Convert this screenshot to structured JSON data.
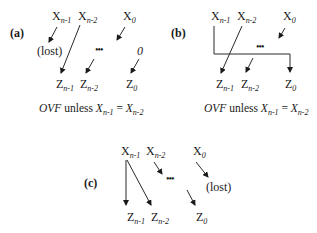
{
  "panels": {
    "a": {
      "label": "(a)",
      "inputs": [
        {
          "base": "X",
          "sub": "n-1"
        },
        {
          "base": "X",
          "sub": "n-2"
        },
        {
          "base": "X",
          "sub": "0"
        }
      ],
      "outputs": [
        {
          "base": "Z",
          "sub": "n-1"
        },
        {
          "base": "Z",
          "sub": "n-2"
        },
        {
          "base": "Z",
          "sub": "0"
        }
      ],
      "lost_label": "(lost)",
      "fill_in": "0",
      "ellipsis": "•••",
      "caption": {
        "prefix": "OVF",
        "middle": " unless ",
        "lhs_base": "X",
        "lhs_sub": "n-1",
        "eq": " = ",
        "rhs_base": "X",
        "rhs_sub": "n-2"
      }
    },
    "b": {
      "label": "(b)",
      "inputs": [
        {
          "base": "X",
          "sub": "n-1"
        },
        {
          "base": "X",
          "sub": "n-2"
        },
        {
          "base": "X",
          "sub": "0"
        }
      ],
      "outputs": [
        {
          "base": "Z",
          "sub": "n-1"
        },
        {
          "base": "Z",
          "sub": "n-2"
        },
        {
          "base": "Z",
          "sub": "0"
        }
      ],
      "ellipsis": "•••",
      "caption": {
        "prefix": "OVF",
        "middle": " unless ",
        "lhs_base": "X",
        "lhs_sub": "n-1",
        "eq": " = ",
        "rhs_base": "X",
        "rhs_sub": "n-2"
      }
    },
    "c": {
      "label": "(c)",
      "inputs": [
        {
          "base": "X",
          "sub": "n-1"
        },
        {
          "base": "X",
          "sub": "n-2"
        },
        {
          "base": "X",
          "sub": "0"
        }
      ],
      "outputs": [
        {
          "base": "Z",
          "sub": "n-1"
        },
        {
          "base": "Z",
          "sub": "n-2"
        },
        {
          "base": "Z",
          "sub": "0"
        }
      ],
      "lost_label": "(lost)",
      "ellipsis": "•••"
    }
  }
}
